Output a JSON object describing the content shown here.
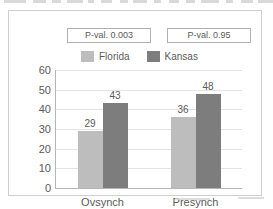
{
  "figure": {
    "pvalues": [
      {
        "label": "P-val. 0.003"
      },
      {
        "label": "P-val. 0.95"
      }
    ]
  },
  "chart_data": {
    "type": "bar",
    "title": "",
    "xlabel": "",
    "ylabel": "",
    "categories": [
      "Ovsynch",
      "Presynch"
    ],
    "series": [
      {
        "name": "Florida",
        "color": "#bdbdbd",
        "values": [
          29,
          36
        ]
      },
      {
        "name": "Kansas",
        "color": "#7d7d7d",
        "values": [
          43,
          48
        ]
      }
    ],
    "bars": [
      {
        "group": "Ovsynch",
        "series": "Florida",
        "value": 29,
        "label": "29"
      },
      {
        "group": "Ovsynch",
        "series": "Kansas",
        "value": 36,
        "label": "36"
      },
      {
        "group": "Presynch",
        "series": "Florida",
        "value": 43,
        "label": "43"
      },
      {
        "group": "Presynch",
        "series": "Kansas",
        "value": 48,
        "label": "48"
      }
    ],
    "ylim": [
      0,
      60
    ],
    "yticks": [
      0,
      10,
      20,
      30,
      40,
      50,
      60
    ],
    "ytick_labels": [
      "0",
      "10",
      "20",
      "30",
      "40",
      "50",
      "60"
    ],
    "grid": true,
    "legend_position": "top"
  }
}
